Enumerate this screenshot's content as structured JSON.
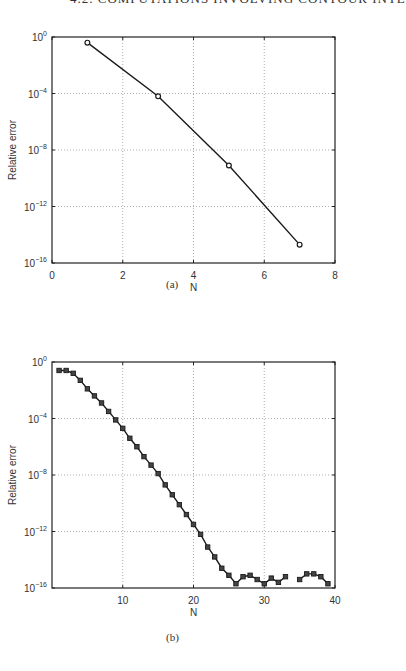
{
  "page_header": "4.2. COMPUTATIONS INVOLVING CONTOUR INTE",
  "chart_data": [
    {
      "id": "a",
      "type": "line",
      "caption": "(a)",
      "xlabel": "N",
      "ylabel": "Relative error",
      "xlim": [
        0,
        8
      ],
      "ylim_log10": [
        -16,
        0
      ],
      "yscale": "log",
      "grid": true,
      "marker": "circle",
      "xticks": [
        0,
        2,
        4,
        6,
        8
      ],
      "xtick_labels": [
        "0",
        "2",
        "4",
        "6",
        "8"
      ],
      "yticks_log10": [
        0,
        -4,
        -8,
        -12,
        -16
      ],
      "ytick_labels": [
        "10^0",
        "10^-4",
        "10^-8",
        "10^-12",
        "10^-16"
      ],
      "x": [
        1,
        3,
        5,
        7
      ],
      "log10_values": [
        -0.4,
        -4.2,
        -9.1,
        -14.7
      ]
    },
    {
      "id": "b",
      "type": "line",
      "caption": "(b)",
      "xlabel": "N",
      "ylabel": "Relative error",
      "xlim": [
        0,
        40
      ],
      "ylim_log10": [
        -16,
        0
      ],
      "yscale": "log",
      "grid": true,
      "marker": "square",
      "xticks": [
        10,
        20,
        30,
        40
      ],
      "xtick_labels": [
        "10",
        "20",
        "30",
        "40"
      ],
      "yticks_log10": [
        0,
        -4,
        -8,
        -12,
        -16
      ],
      "ytick_labels": [
        "10^0",
        "10^-4",
        "10^-8",
        "10^-12",
        "10^-16"
      ],
      "segments": [
        {
          "x": [
            1,
            2,
            3,
            4,
            5,
            6,
            7,
            8,
            9,
            10,
            11,
            12,
            13,
            14,
            15,
            16,
            17,
            18,
            19,
            20,
            21,
            22,
            23,
            24,
            25,
            26,
            27,
            28,
            29,
            30,
            31,
            32,
            33
          ],
          "log10_values": [
            -0.6,
            -0.6,
            -0.8,
            -1.3,
            -1.9,
            -2.4,
            -2.9,
            -3.5,
            -4.1,
            -4.7,
            -5.4,
            -6.0,
            -6.7,
            -7.3,
            -7.9,
            -8.7,
            -9.4,
            -10.1,
            -10.8,
            -11.5,
            -12.2,
            -13.1,
            -13.8,
            -14.6,
            -15.1,
            -15.7,
            -15.2,
            -15.1,
            -15.4,
            -15.7,
            -15.3,
            -15.6,
            -15.2
          ]
        },
        {
          "x": [
            35,
            36,
            37,
            38,
            39
          ],
          "log10_values": [
            -15.4,
            -15.0,
            -15.0,
            -15.2,
            -15.7
          ]
        }
      ]
    }
  ]
}
